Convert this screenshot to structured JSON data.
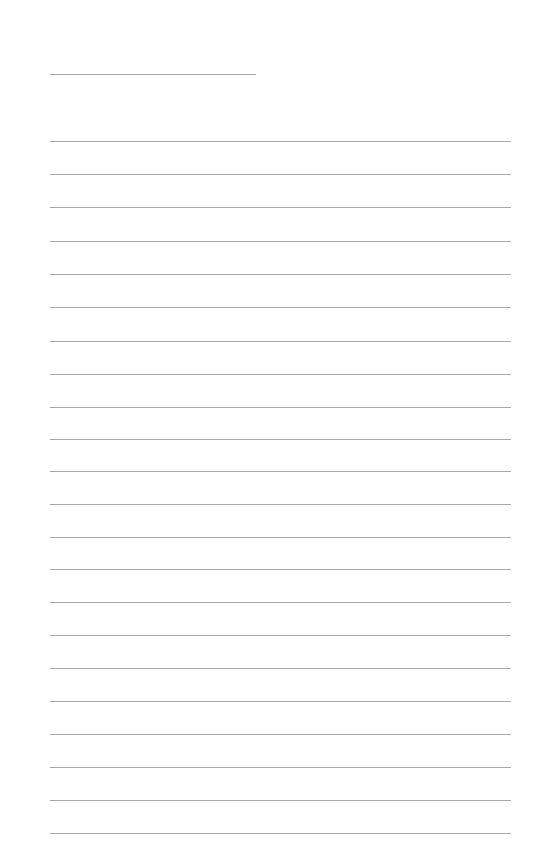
{
  "page": {
    "type": "lined-paper",
    "background_color": "#ffffff",
    "line_color": "#a9a9a9",
    "header_line": {
      "x1": 50,
      "x2": 256,
      "y": 74
    },
    "ruled_lines": {
      "x1": 50,
      "x2": 511,
      "y_positions": [
        141,
        174,
        207,
        241,
        274,
        307,
        341,
        374,
        407,
        439,
        471,
        504,
        537,
        569,
        602,
        635,
        668,
        701,
        734,
        767,
        800,
        833
      ]
    }
  }
}
